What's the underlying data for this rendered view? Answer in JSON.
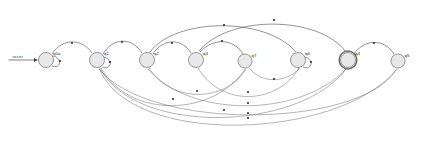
{
  "diagram": {
    "type": "state-machine",
    "colors": {
      "node_fill": "#e8e8e8",
      "node_stroke": "#7d7d7d",
      "edge": "#3a3a3a",
      "accept_ring": "#6e6e6e",
      "background": "#ffffff"
    },
    "start": {
      "label": "reset",
      "target": "q0"
    },
    "states": [
      {
        "id": "q0",
        "label": "q0a",
        "cx": 46,
        "cy": 60,
        "r": 7.5,
        "accepting": false,
        "self_loop": true
      },
      {
        "id": "q1",
        "label": "q1",
        "cx": 97,
        "cy": 60,
        "r": 7.5,
        "accepting": false,
        "self_loop": true
      },
      {
        "id": "q2",
        "label": "q2",
        "cx": 147,
        "cy": 60,
        "r": 7.5,
        "accepting": false,
        "self_loop": false
      },
      {
        "id": "q3",
        "label": "q3",
        "cx": 196,
        "cy": 60,
        "r": 7.5,
        "accepting": false,
        "self_loop": false
      },
      {
        "id": "q7",
        "label": "q7",
        "cx": 245,
        "cy": 61,
        "r": 7.0,
        "accepting": false,
        "self_loop": false
      },
      {
        "id": "q6",
        "label": "q6",
        "cx": 298,
        "cy": 60,
        "r": 7.5,
        "accepting": false,
        "self_loop": true
      },
      {
        "id": "q4",
        "label": "q4",
        "cx": 348,
        "cy": 60,
        "r": 7.5,
        "accepting": true,
        "self_loop": false
      },
      {
        "id": "q5",
        "label": "q5",
        "cx": 398,
        "cy": 61,
        "r": 7.0,
        "accepting": false,
        "self_loop": false
      }
    ],
    "edges_above": [
      {
        "from": "q0",
        "to": "q1",
        "path": "M 52 54 C 62 38 82 38 92 53",
        "mid": [
          72,
          43
        ]
      },
      {
        "from": "q1",
        "to": "q2",
        "path": "M 103 54 C 113 37 132 37 142 53",
        "mid": [
          122,
          42
        ]
      },
      {
        "from": "q2",
        "to": "q3",
        "path": "M 153 54 C 163 38 182 38 191 53",
        "mid": [
          172,
          43
        ]
      },
      {
        "from": "q2",
        "to": "q6",
        "path": "M 150 52 C 175 18 265 16 296 52",
        "mid": [
          224,
          25
        ]
      },
      {
        "from": "q3",
        "to": "q7",
        "path": "M 200 52 C 214 37 234 39 243 54",
        "mid": [
          222,
          41
        ]
      },
      {
        "from": "q3",
        "to": "q4",
        "path": "M 199 51 C 230 14 320 16 346 52",
        "mid": [
          274,
          20
        ]
      },
      {
        "from": "q4",
        "to": "q5",
        "path": "M 354 54 C 365 38 385 39 394 54",
        "mid": [
          374,
          43
        ]
      }
    ],
    "edges_below": [
      {
        "from": "q1",
        "to": "q5",
        "path": "M 99 68 C 130 148 340 140 397 69",
        "mid": [
          248,
          118
        ]
      },
      {
        "from": "q1",
        "to": "q4",
        "path": "M 100 68 C 135 136 300 132 347 68",
        "mid": [
          224,
          110
        ]
      },
      {
        "from": "q1",
        "to": "q7",
        "path": "M 101 68 C 130 120 215 116 245 69",
        "mid": [
          173,
          99
        ]
      },
      {
        "from": "q2",
        "to": "q7",
        "path": "M 149 68 C 172 104 226 102 246 69",
        "mid": [
          197,
          91
        ]
      },
      {
        "from": "q3",
        "to": "q6",
        "path": "M 198 68 C 222 108 278 104 299 68",
        "mid": [
          248,
          92
        ]
      },
      {
        "from": "q7",
        "to": "q6",
        "path": "M 249 68 C 262 84 286 83 300 68",
        "mid": [
          274,
          79
        ]
      },
      {
        "from": "q5",
        "to": "q1",
        "path": "M 396 70 C 360 128 150 132 99 69",
        "mid": [
          248,
          113
        ]
      },
      {
        "from": "q4",
        "to": "q2",
        "path": "M 346 69 C 300 118 190 118 148 69",
        "mid": [
          248,
          103
        ]
      }
    ],
    "self_loops": [
      {
        "state": "q0",
        "path": "M 52 56 C 62 56 62 70 52 66",
        "mid": [
          60,
          61
        ]
      },
      {
        "state": "q1",
        "path": "M 103 57 C 113 58 112 71 102 67",
        "mid": [
          110,
          62
        ]
      },
      {
        "state": "q6",
        "path": "M 304 57 C 314 58 313 71 303 67",
        "mid": [
          311,
          62
        ]
      }
    ]
  }
}
